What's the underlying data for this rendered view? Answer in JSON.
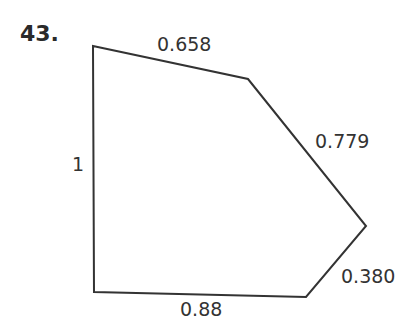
{
  "problem": {
    "number": "43."
  },
  "figure": {
    "shape": "pentagon",
    "vertices": [
      [
        93,
        46
      ],
      [
        248,
        79
      ],
      [
        366,
        226
      ],
      [
        306,
        297
      ],
      [
        94,
        292
      ]
    ],
    "stroke_color": "#333333",
    "side_labels": {
      "top": "0.658",
      "upper_right": "0.779",
      "lower_right": "0.380",
      "bottom": "0.88",
      "left": "1"
    }
  }
}
